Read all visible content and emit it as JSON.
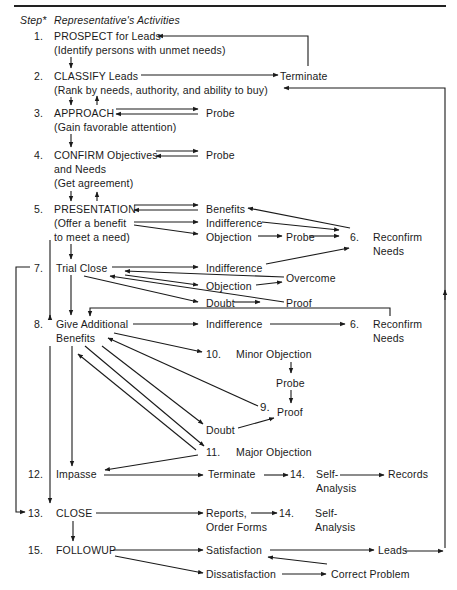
{
  "header": {
    "step_label": "Step*",
    "activities_label": "Representative's Activities"
  },
  "steps": [
    {
      "num": "1.",
      "title": "PROSPECT for Leads",
      "sub": "(Identify persons with unmet needs)"
    },
    {
      "num": "2.",
      "title": "CLASSIFY Leads",
      "sub": "(Rank by needs, authority, and ability to buy)"
    },
    {
      "num": "3.",
      "title": "APPROACH",
      "sub": "(Gain favorable attention)"
    },
    {
      "num": "4.",
      "title": "CONFIRM Objectives",
      "sub": "and Needs",
      "sub2": "(Get agreement)"
    },
    {
      "num": "5.",
      "title": "PRESENTATION",
      "sub": "(Offer a benefit",
      "sub2": "to meet a need)"
    },
    {
      "num": "7.",
      "title": "Trial Close"
    },
    {
      "num": "8.",
      "title": "Give Additional",
      "sub": "Benefits"
    },
    {
      "num": "12.",
      "title": "Impasse"
    },
    {
      "num": "13.",
      "title": "CLOSE"
    },
    {
      "num": "15.",
      "title": "FOLLOWUP"
    }
  ],
  "outcomes": {
    "terminate_2": "Terminate",
    "probe_3": "Probe",
    "probe_4": "Probe",
    "benefits_5": "Benefits",
    "indifference_5": "Indifference",
    "objection_5": "Objection",
    "probe_5": "Probe",
    "reconfirm_6a_num": "6.",
    "reconfirm_6a_1": "Reconfirm",
    "reconfirm_6a_2": "Needs",
    "indifference_7": "Indifference",
    "overcome_7": "Overcome",
    "objection_7": "Objection",
    "doubt_7": "Doubt",
    "proof_7": "Proof",
    "indifference_8": "Indifference",
    "reconfirm_6b_num": "6.",
    "reconfirm_6b_1": "Reconfirm",
    "reconfirm_6b_2": "Needs",
    "minor_num": "10.",
    "minor_label": "Minor Objection",
    "probe_10": "Probe",
    "proof_num": "9.",
    "proof_9": "Proof",
    "doubt_8": "Doubt",
    "major_num": "11.",
    "major_label": "Major Objection",
    "terminate_12": "Terminate",
    "self_num_a": "14.",
    "self_a1": "Self-",
    "self_a2": "Analysis",
    "records": "Records",
    "reports_1": "Reports,",
    "reports_2": "Order Forms",
    "self_num_b": "14.",
    "self_b1": "Self-",
    "self_b2": "Analysis",
    "satisfaction": "Satisfaction",
    "leads": "Leads",
    "dissatisfaction": "Dissatisfaction",
    "correct_problem": "Correct Problem"
  }
}
